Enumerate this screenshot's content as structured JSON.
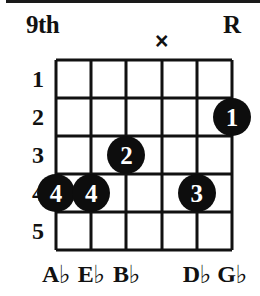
{
  "diagram": {
    "position_label": "9th",
    "root_marker": "R",
    "mute_symbol": "×",
    "strings_count": 6,
    "frets_count": 5,
    "fret_numbers": [
      "1",
      "2",
      "3",
      "4",
      "5"
    ],
    "markers": [
      {
        "symbol": "×",
        "string": 4,
        "name": "mute-marker-string-4"
      },
      {
        "symbol": "R",
        "string": 6,
        "name": "root-marker-string-6"
      }
    ],
    "dots": [
      {
        "finger": "1",
        "string": 6,
        "fret": 2
      },
      {
        "finger": "2",
        "string": 3,
        "fret": 3
      },
      {
        "finger": "3",
        "string": 5,
        "fret": 4
      },
      {
        "finger": "4",
        "string": 1,
        "fret": 4
      },
      {
        "finger": "4",
        "string": 2,
        "fret": 4
      }
    ],
    "note_names": [
      {
        "string": 1,
        "letter": "A",
        "accidental": "♭"
      },
      {
        "string": 2,
        "letter": "E",
        "accidental": "♭"
      },
      {
        "string": 3,
        "letter": "B",
        "accidental": "♭"
      },
      {
        "string": 4,
        "letter": "",
        "accidental": ""
      },
      {
        "string": 5,
        "letter": "D",
        "accidental": "♭"
      },
      {
        "string": 6,
        "letter": "G",
        "accidental": "♭"
      }
    ],
    "colors": {
      "ink": "#111111",
      "dot_fill": "#0d0d0d",
      "dot_text": "#ffffff",
      "background": "#ffffff"
    },
    "geometry": {
      "grid_left": 56,
      "grid_top": 60,
      "grid_right": 232,
      "grid_bottom": 250
    }
  }
}
